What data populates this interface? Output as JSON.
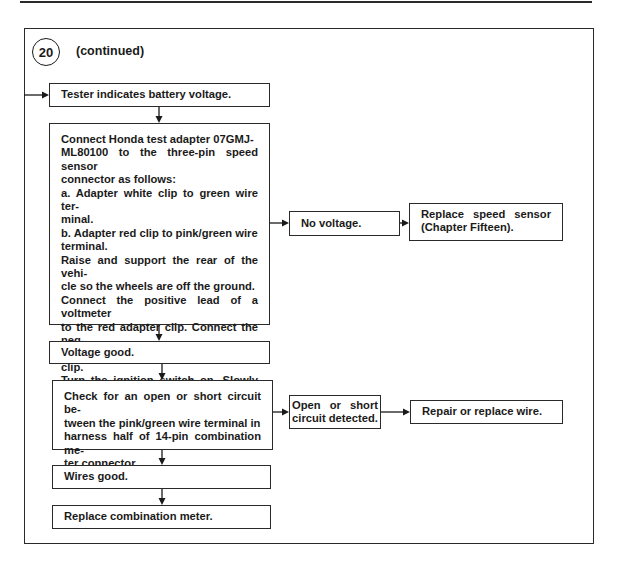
{
  "header": {
    "step_number": "20",
    "step_label": "(continued)"
  },
  "flowchart": {
    "nodes": [
      {
        "id": "tester_battery",
        "text": "Tester indicates battery voltage."
      },
      {
        "id": "connect_adapter",
        "lines": [
          "Connect Honda test adapter 07GMJ-",
          "ML80100 to the three-pin speed sensor",
          "connector as follows:",
          "a. Adapter white clip to green wire ter-",
          "minal.",
          "b. Adapter red clip to pink/green wire",
          "terminal.",
          "Raise and support the rear of the vehi-",
          "cle so the wheels are off the ground.",
          "Connect the positive lead of a voltmeter",
          "to the red adapter clip. Connect the neg-",
          "ative test lead to the white adapter clip.",
          "Turn the ignition switch on. Slowly ro-",
          "tate the rear wheels. The voltmeter",
          "should indicate 0-5 volts."
        ]
      },
      {
        "id": "no_voltage",
        "text": "No voltage."
      },
      {
        "id": "replace_sensor",
        "lines": [
          "Replace speed sensor",
          "(Chapter Fifteen)."
        ]
      },
      {
        "id": "voltage_good",
        "text": "Voltage good."
      },
      {
        "id": "check_circuit",
        "lines": [
          "Check for an open or short circuit be-",
          "tween the pink/green wire terminal in",
          "harness half of 14-pin combination me-",
          "ter connector."
        ]
      },
      {
        "id": "open_short",
        "lines": [
          "Open or short",
          "circuit detected."
        ]
      },
      {
        "id": "repair_wire",
        "text": "Repair or replace wire."
      },
      {
        "id": "wires_good",
        "text": "Wires good."
      },
      {
        "id": "replace_meter",
        "text": "Replace combination meter."
      }
    ],
    "edges": [
      [
        "entry",
        "tester_battery"
      ],
      [
        "tester_battery",
        "connect_adapter"
      ],
      [
        "connect_adapter",
        "no_voltage"
      ],
      [
        "no_voltage",
        "replace_sensor"
      ],
      [
        "connect_adapter",
        "voltage_good"
      ],
      [
        "voltage_good",
        "check_circuit"
      ],
      [
        "check_circuit",
        "open_short"
      ],
      [
        "open_short",
        "repair_wire"
      ],
      [
        "check_circuit",
        "wires_good"
      ],
      [
        "wires_good",
        "replace_meter"
      ]
    ]
  },
  "colors": {
    "line": "#1a1a1a",
    "background": "#ffffff"
  }
}
